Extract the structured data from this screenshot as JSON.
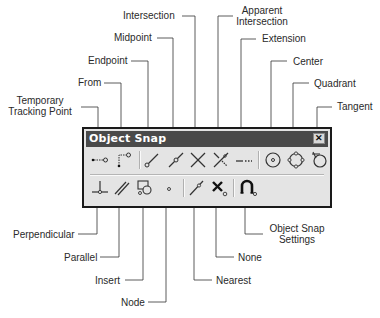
{
  "toolbar": {
    "title": "Object Snap",
    "close_icon": "close-icon",
    "row1": [
      {
        "label": "Temporary Tracking Point",
        "icon": "temporary-tracking-point-icon"
      },
      {
        "label": "From",
        "icon": "from-icon"
      },
      {
        "label": "Endpoint",
        "icon": "endpoint-icon"
      },
      {
        "label": "Midpoint",
        "icon": "midpoint-icon"
      },
      {
        "label": "Intersection",
        "icon": "intersection-icon"
      },
      {
        "label": "Apparent Intersection",
        "icon": "apparent-intersection-icon"
      },
      {
        "label": "Extension",
        "icon": "extension-icon"
      },
      {
        "label": "Center",
        "icon": "center-icon"
      },
      {
        "label": "Quadrant",
        "icon": "quadrant-icon"
      },
      {
        "label": "Tangent",
        "icon": "tangent-icon"
      }
    ],
    "row2": [
      {
        "label": "Perpendicular",
        "icon": "perpendicular-icon"
      },
      {
        "label": "Parallel",
        "icon": "parallel-icon"
      },
      {
        "label": "Insert",
        "icon": "insert-icon"
      },
      {
        "label": "Node",
        "icon": "node-icon"
      },
      {
        "label": "Nearest",
        "icon": "nearest-icon"
      },
      {
        "label": "None",
        "icon": "none-icon"
      },
      {
        "label": "Object Snap Settings",
        "icon": "object-snap-settings-icon"
      }
    ]
  },
  "callouts": {
    "temporary_tracking_point_1": "Temporary",
    "temporary_tracking_point_2": "Tracking Point",
    "from": "From",
    "endpoint": "Endpoint",
    "midpoint": "Midpoint",
    "intersection": "Intersection",
    "apparent_intersection_1": "Apparent",
    "apparent_intersection_2": "Intersection",
    "extension": "Extension",
    "center": "Center",
    "quadrant": "Quadrant",
    "tangent": "Tangent",
    "perpendicular": "Perpendicular",
    "parallel": "Parallel",
    "insert": "Insert",
    "node": "Node",
    "nearest": "Nearest",
    "none": "None",
    "object_snap_settings_1": "Object Snap",
    "object_snap_settings_2": "Settings"
  }
}
